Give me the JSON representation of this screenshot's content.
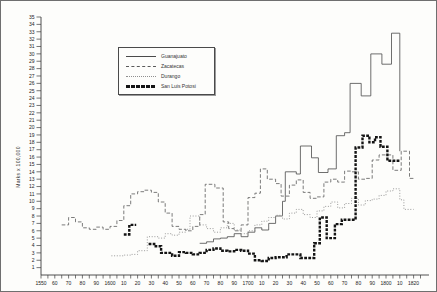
{
  "figure": {
    "title": ""
  },
  "chart_data": {
    "type": "line",
    "subtype": "step-post",
    "title": "",
    "xlabel": "",
    "ylabel": "Marks x 100,000",
    "ylim": [
      0,
      35
    ],
    "xlim": [
      1550,
      1830
    ],
    "grid": "off",
    "y_ticks": {
      "min": 1,
      "max": 35,
      "step": 1
    },
    "x_minor_tick_step_years": 5,
    "x_decade_labels": [
      "1550",
      "60",
      "70",
      "80",
      "90",
      "1600",
      "10",
      "20",
      "30",
      "40",
      "50",
      "60",
      "70",
      "80",
      "90",
      "1700",
      "10",
      "20",
      "30",
      "40",
      "50",
      "60",
      "70",
      "80",
      "90",
      "1800",
      "10",
      "1820"
    ],
    "legend": {
      "position": "upper-left-inside",
      "items": [
        {
          "label": "Guanajuato",
          "style": "solid"
        },
        {
          "label": "Zacatecas",
          "style": "dashed"
        },
        {
          "label": "Durango",
          "style": "dotted"
        },
        {
          "label": "San Luis Potosi",
          "style": "bold"
        }
      ]
    },
    "series": [
      {
        "name": "Guanajuato",
        "style": "solid",
        "color": "#4a4a4a",
        "segments": [
          {
            "points": [
              [
                1665,
                4.3
              ],
              [
                1670,
                4.5
              ],
              [
                1675,
                4.9
              ],
              [
                1680,
                5.0
              ],
              [
                1685,
                5.2
              ],
              [
                1690,
                5.6
              ],
              [
                1695,
                5.2
              ],
              [
                1700,
                5.8
              ],
              [
                1705,
                6.4
              ],
              [
                1710,
                6.1
              ],
              [
                1715,
                7.0
              ],
              [
                1720,
                8.0
              ],
              [
                1725,
                10.0
              ],
              [
                1727,
                14.0
              ],
              [
                1735,
                13.7
              ],
              [
                1738,
                17.5
              ],
              [
                1746,
                15.9
              ],
              [
                1751,
                13.9
              ],
              [
                1758,
                14.4
              ],
              [
                1764,
                18.9
              ],
              [
                1770,
                19.3
              ],
              [
                1774,
                26.0
              ],
              [
                1782,
                24.3
              ],
              [
                1789,
                30.0
              ],
              [
                1797,
                28.6
              ],
              [
                1804,
                32.8
              ],
              [
                1810,
                16.8
              ]
            ],
            "end": 1810
          }
        ]
      },
      {
        "name": "Zacatecas",
        "style": "dashed",
        "color": "#5a5a5a",
        "segments": [
          {
            "points": [
              [
                1565,
                6.8
              ],
              [
                1570,
                7.8
              ],
              [
                1575,
                7.2
              ],
              [
                1580,
                6.4
              ],
              [
                1585,
                6.2
              ],
              [
                1590,
                6.5
              ],
              [
                1595,
                6.2
              ],
              [
                1600,
                6.6
              ],
              [
                1605,
                7.4
              ],
              [
                1610,
                9.4
              ],
              [
                1615,
                11.0
              ],
              [
                1620,
                11.3
              ],
              [
                1625,
                11.5
              ],
              [
                1630,
                11.2
              ],
              [
                1635,
                9.9
              ],
              [
                1640,
                8.4
              ],
              [
                1645,
                6.6
              ],
              [
                1650,
                6.2
              ],
              [
                1655,
                6.0
              ],
              [
                1660,
                6.6
              ],
              [
                1665,
                8.2
              ],
              [
                1669,
                12.3
              ],
              [
                1676,
                11.8
              ],
              [
                1682,
                7.2
              ],
              [
                1686,
                6.3
              ],
              [
                1690,
                6.0
              ],
              [
                1695,
                6.8
              ],
              [
                1700,
                10.5
              ],
              [
                1705,
                11.1
              ],
              [
                1709,
                14.4
              ],
              [
                1714,
                13.0
              ],
              [
                1720,
                12.4
              ],
              [
                1724,
                10.7
              ],
              [
                1730,
                12.2
              ],
              [
                1735,
                12.9
              ],
              [
                1740,
                11.2
              ],
              [
                1745,
                10.4
              ],
              [
                1750,
                10.6
              ],
              [
                1755,
                12.6
              ],
              [
                1760,
                13.0
              ],
              [
                1765,
                12.6
              ],
              [
                1770,
                14.1
              ],
              [
                1775,
                14.0
              ],
              [
                1780,
                13.0
              ],
              [
                1785,
                13.1
              ],
              [
                1790,
                15.6
              ],
              [
                1795,
                16.3
              ],
              [
                1805,
                14.2
              ],
              [
                1811,
                16.8
              ],
              [
                1817,
                13.1
              ]
            ],
            "end": 1820
          }
        ]
      },
      {
        "name": "Durango",
        "style": "dotted",
        "color": "#8f8f8f",
        "segments": [
          {
            "points": [
              [
                1601,
                2.6
              ],
              [
                1605,
                2.6
              ],
              [
                1610,
                2.7
              ],
              [
                1615,
                2.8
              ],
              [
                1620,
                3.3
              ],
              [
                1627,
                5.2
              ],
              [
                1635,
                5.0
              ],
              [
                1640,
                5.6
              ],
              [
                1645,
                5.4
              ],
              [
                1650,
                5.8
              ],
              [
                1655,
                6.2
              ],
              [
                1658,
                8.0
              ],
              [
                1665,
                6.8
              ],
              [
                1670,
                6.3
              ],
              [
                1675,
                5.8
              ],
              [
                1680,
                6.4
              ],
              [
                1685,
                7.0
              ],
              [
                1690,
                6.1
              ],
              [
                1695,
                5.6
              ],
              [
                1700,
                6.0
              ],
              [
                1705,
                6.8
              ],
              [
                1710,
                7.3
              ],
              [
                1715,
                7.8
              ],
              [
                1720,
                8.1
              ],
              [
                1725,
                7.6
              ],
              [
                1730,
                8.4
              ],
              [
                1735,
                8.9
              ],
              [
                1740,
                8.2
              ],
              [
                1745,
                7.8
              ],
              [
                1750,
                8.7
              ],
              [
                1755,
                9.3
              ],
              [
                1760,
                9.9
              ],
              [
                1765,
                9.1
              ],
              [
                1770,
                9.7
              ],
              [
                1775,
                10.4
              ],
              [
                1780,
                9.5
              ],
              [
                1785,
                10.1
              ],
              [
                1790,
                10.3
              ],
              [
                1795,
                10.8
              ],
              [
                1800,
                11.4
              ],
              [
                1805,
                11.7
              ],
              [
                1810,
                10.2
              ],
              [
                1813,
                8.9
              ]
            ],
            "end": 1820
          }
        ]
      },
      {
        "name": "San Luis Potosi",
        "style": "bold",
        "color": "#141414",
        "segments": [
          {
            "points": [
              [
                1610,
                5.5
              ],
              [
                1614,
                6.8
              ]
            ],
            "end": 1619
          },
          {
            "points": [
              [
                1628,
                4.2
              ],
              [
                1632,
                3.9
              ],
              [
                1637,
                3.0
              ],
              [
                1645,
                2.6
              ],
              [
                1650,
                3.1
              ],
              [
                1655,
                3.0
              ],
              [
                1660,
                2.8
              ],
              [
                1665,
                3.0
              ],
              [
                1670,
                3.4
              ],
              [
                1675,
                3.6
              ],
              [
                1680,
                3.3
              ],
              [
                1685,
                3.2
              ],
              [
                1690,
                3.4
              ],
              [
                1695,
                3.3
              ],
              [
                1700,
                2.9
              ],
              [
                1705,
                2.0
              ],
              [
                1710,
                1.9
              ],
              [
                1715,
                2.3
              ],
              [
                1720,
                2.4
              ],
              [
                1728,
                2.8
              ],
              [
                1738,
                2.3
              ],
              [
                1748,
                4.3
              ],
              [
                1752,
                7.8
              ],
              [
                1757,
                5.0
              ],
              [
                1763,
                6.9
              ],
              [
                1768,
                7.5
              ],
              [
                1778,
                17.3
              ],
              [
                1783,
                18.9
              ],
              [
                1788,
                18.0
              ],
              [
                1792,
                18.7
              ],
              [
                1796,
                17.4
              ],
              [
                1801,
                15.5
              ]
            ],
            "end": 1810
          }
        ]
      }
    ]
  }
}
